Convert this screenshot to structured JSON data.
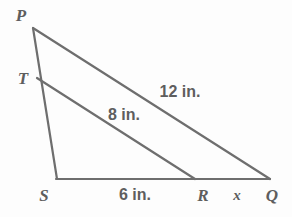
{
  "figure": {
    "background_color": "#fdfdfd",
    "stroke_color": "#6e6e6e",
    "text_color": "#5e5e5e",
    "stroke_width": 2.2,
    "width": 292,
    "height": 217
  },
  "vertices": [
    {
      "name": "P",
      "label": "P",
      "x": 33,
      "y": 28,
      "label_x": 21,
      "label_y": 15
    },
    {
      "name": "T",
      "label": "T",
      "x": 37,
      "y": 78,
      "label_x": 23,
      "label_y": 78
    },
    {
      "name": "S",
      "label": "S",
      "x": 57,
      "y": 179,
      "label_x": 44,
      "label_y": 195
    },
    {
      "name": "R",
      "label": "R",
      "x": 195,
      "y": 179,
      "label_x": 203,
      "label_y": 195
    },
    {
      "name": "Q",
      "label": "Q",
      "x": 270,
      "y": 179,
      "label_x": 272,
      "label_y": 195
    }
  ],
  "segments": [
    {
      "name": "segment-PQ",
      "from": "P",
      "to": "Q",
      "x1": 33,
      "y1": 28,
      "x2": 270,
      "y2": 179
    },
    {
      "name": "segment-TR",
      "from": "T",
      "to": "R",
      "x1": 37,
      "y1": 78,
      "x2": 195,
      "y2": 179
    },
    {
      "name": "segment-PS",
      "from": "P",
      "to": "S",
      "x1": 33,
      "y1": 28,
      "x2": 57,
      "y2": 179
    },
    {
      "name": "segment-SQ",
      "from": "S",
      "to": "Q",
      "x1": 57,
      "y1": 179,
      "x2": 270,
      "y2": 179
    }
  ],
  "measures": [
    {
      "name": "measure-PQ",
      "text": "12 in.",
      "x": 180,
      "y": 92,
      "segment": "PQ"
    },
    {
      "name": "measure-TR",
      "text": "8 in.",
      "x": 124,
      "y": 115,
      "segment": "TR"
    },
    {
      "name": "measure-SR",
      "text": "6 in.",
      "x": 135,
      "y": 195,
      "segment": "SR"
    },
    {
      "name": "measure-RQ",
      "text": "x",
      "x": 237,
      "y": 195,
      "segment": "RQ"
    }
  ]
}
